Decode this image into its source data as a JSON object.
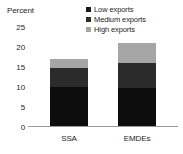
{
  "chart_data": {
    "type": "bar",
    "stacked": true,
    "title": "",
    "subtitle": "",
    "xlabel": "",
    "ylabel": "Percent",
    "categories": [
      "SSA",
      "EMDEs"
    ],
    "ylim": [
      0,
      25
    ],
    "yticks": [
      0,
      5,
      10,
      15,
      20,
      25
    ],
    "ytick_labels": [
      "0",
      "5",
      "10",
      "15",
      "20",
      "25"
    ],
    "grid": false,
    "legend_position": "top-right",
    "series": [
      {
        "name": "Low exports",
        "values": [
          9.7,
          9.6
        ],
        "color": "#0d0d0d"
      },
      {
        "name": "Medium exports",
        "values": [
          4.7,
          6.1
        ],
        "color": "#2b2b2b"
      },
      {
        "name": "High exports",
        "values": [
          2.3,
          5.1
        ],
        "color": "#a6a6a6"
      }
    ],
    "totals": [
      16.7,
      20.8
    ]
  },
  "axis": {
    "unit_label": "Percent"
  },
  "legend": {
    "items": [
      {
        "label": "Low exports",
        "swatch": "#1a1a1a"
      },
      {
        "label": "Medium exports",
        "swatch": "#2b2b2b"
      },
      {
        "label": "High exports",
        "swatch": "#a6a6a6"
      }
    ]
  }
}
